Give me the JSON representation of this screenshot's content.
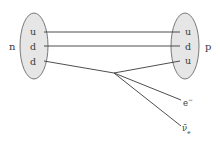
{
  "diagram": {
    "colors": {
      "nucleon_fill": "#e6e6e6",
      "nucleon_stroke": "#6a6a6a",
      "line": "#3a3a3a",
      "text": "#3a3a3a"
    },
    "neutron": {
      "label": "n",
      "quarks": [
        "u",
        "d",
        "d"
      ]
    },
    "proton": {
      "label": "p",
      "quarks": [
        "u",
        "d",
        "u"
      ]
    },
    "products": {
      "electron": {
        "base": "e",
        "sup": "−"
      },
      "antineutrino": {
        "base": "ν̄",
        "sub": "e"
      }
    }
  }
}
